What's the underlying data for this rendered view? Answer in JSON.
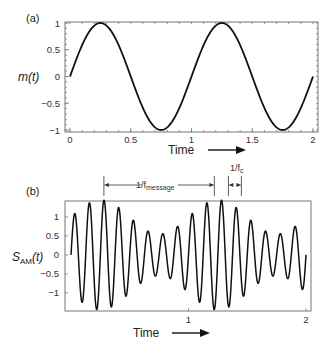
{
  "chart_data": [
    {
      "type": "line",
      "panel_tag": "(a)",
      "title": "",
      "xlabel": "Time",
      "xlabel_arrow": "right",
      "ylabel": "m(t)",
      "xlim": [
        0,
        2
      ],
      "ylim": [
        -1,
        1
      ],
      "x_ticks": [
        0,
        0.5,
        1,
        1.5,
        2
      ],
      "x_tick_labels": [
        "0",
        "0.5",
        "1",
        "1.5",
        "2"
      ],
      "y_ticks": [
        1,
        0.5,
        0,
        -0.5,
        -1
      ],
      "y_tick_labels": [
        "1",
        "0.5",
        "0",
        "−0.5",
        "−1"
      ],
      "grid": false,
      "series": [
        {
          "name": "m(t)",
          "function": "sin(2*pi*f_message*t)",
          "f_message": 1,
          "amplitude": 1,
          "t_range": [
            0,
            2
          ],
          "x": [
            0,
            0.125,
            0.25,
            0.375,
            0.5,
            0.625,
            0.75,
            0.875,
            1.0,
            1.125,
            1.25,
            1.375,
            1.5,
            1.625,
            1.75,
            1.875,
            2.0
          ],
          "y": [
            0,
            0.707,
            1,
            0.707,
            0,
            -0.707,
            -1,
            -0.707,
            0,
            0.707,
            1,
            0.707,
            0,
            -0.707,
            -1,
            -0.707,
            0
          ]
        }
      ]
    },
    {
      "type": "line",
      "panel_tag": "(b)",
      "title": "",
      "xlabel": "Time",
      "xlabel_arrow": "right",
      "ylabel": "S",
      "ylabel_sub": "AM",
      "ylabel_suffix": "(t)",
      "xlim": [
        -0.04,
        2.04
      ],
      "ylim": [
        -1.48,
        1.42
      ],
      "x_ticks": [
        1,
        2
      ],
      "x_tick_labels": [
        "1",
        "2"
      ],
      "y_ticks": [
        1,
        0.5,
        0,
        -0.5,
        -1
      ],
      "y_tick_labels": [
        "1",
        "0.5",
        "0",
        "−0.5",
        "−1"
      ],
      "grid": false,
      "series": [
        {
          "name": "S_AM(t)",
          "function": "(1 + k*m(t)) * sin(2*pi*f_c*t)",
          "k": 0.45,
          "f_message": 1,
          "f_c": 8,
          "t_range": [
            0,
            2
          ]
        }
      ],
      "annotations": [
        {
          "label_main": "1/f",
          "label_sub": "message",
          "span_t": [
            0.28,
            1.22
          ],
          "meaning": "message period"
        },
        {
          "label_main": "1/f",
          "label_sub": "c",
          "span_t": [
            1.34,
            1.45
          ],
          "meaning": "carrier period"
        }
      ]
    }
  ]
}
